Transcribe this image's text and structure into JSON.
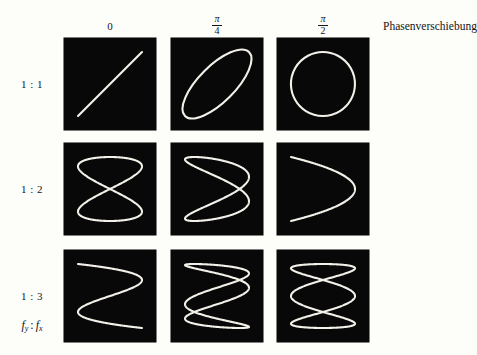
{
  "figure": {
    "caption_right": "Phasenverschiebung",
    "ratio_caption": {
      "f": "f",
      "sub_y": "y",
      "colon": ":",
      "f2": "f",
      "sub_x": "x"
    },
    "background_color": "#fdfdfa",
    "panel_color": "#080808",
    "curve_color": "#f2f0e8"
  },
  "columns": [
    {
      "label": "0",
      "type": "plain",
      "numerator": "",
      "denominator": "",
      "phase_value": 0
    },
    {
      "label": "π/4",
      "type": "fraction",
      "numerator": "π",
      "denominator": "4",
      "phase_value": 0.7853981634
    },
    {
      "label": "π/2",
      "type": "fraction",
      "numerator": "π",
      "denominator": "2",
      "phase_value": 1.5707963268
    }
  ],
  "rows": [
    {
      "label": "1 : 1",
      "ratio_y": 1,
      "ratio_x": 1
    },
    {
      "label": "1 : 2",
      "ratio_y": 1,
      "ratio_x": 2
    },
    {
      "label": "1 : 3",
      "ratio_y": 1,
      "ratio_x": 3
    }
  ],
  "chart_data": {
    "type": "line",
    "xlabel": "Phasenverschiebung",
    "ylabel": "fy : fx",
    "grid": false,
    "legend": "none",
    "xlim": [
      -1,
      1
    ],
    "ylim": [
      -1,
      1
    ],
    "column_phases": [
      0,
      0.7853981634,
      1.5707963268
    ],
    "column_tick_labels": [
      "0",
      "π/4",
      "π/2"
    ],
    "row_tick_labels": [
      "1 : 1",
      "1 : 2",
      "1 : 3"
    ],
    "row_frequency_ratios": [
      [
        1,
        1
      ],
      [
        1,
        2
      ],
      [
        1,
        3
      ]
    ],
    "parametric_form": "x = sin(fx*t + phase), y = sin(fy*t)",
    "series": [
      {
        "name": "1:1, phase 0",
        "fy": 1,
        "fx": 1,
        "phase": 0,
        "shape": "diagonal-line"
      },
      {
        "name": "1:1, phase pi/4",
        "fy": 1,
        "fx": 1,
        "phase": 0.7853981634,
        "shape": "tilted-ellipse"
      },
      {
        "name": "1:1, phase pi/2",
        "fy": 1,
        "fx": 1,
        "phase": 1.5707963268,
        "shape": "circle"
      },
      {
        "name": "1:2, phase 0",
        "fy": 1,
        "fx": 2,
        "phase": 0,
        "shape": "figure-eight"
      },
      {
        "name": "1:2, phase pi/4",
        "fy": 1,
        "fx": 2,
        "phase": 0.7853981634,
        "shape": "skewed-figure-eight"
      },
      {
        "name": "1:2, phase pi/2",
        "fy": 1,
        "fx": 2,
        "phase": 1.5707963268,
        "shape": "parabola"
      },
      {
        "name": "1:3, phase 0",
        "fy": 1,
        "fx": 3,
        "phase": 0,
        "shape": "z-curve"
      },
      {
        "name": "1:3, phase pi/4",
        "fy": 1,
        "fx": 3,
        "phase": 0.7853981634,
        "shape": "triple-loop-skewed"
      },
      {
        "name": "1:3, phase pi/2",
        "fy": 1,
        "fx": 3,
        "phase": 1.5707963268,
        "shape": "triple-loop-symmetric"
      }
    ]
  },
  "geometry": {
    "panel_size": 92,
    "col_x": [
      64,
      171,
      277
    ],
    "row_y": [
      38,
      143,
      250
    ]
  }
}
